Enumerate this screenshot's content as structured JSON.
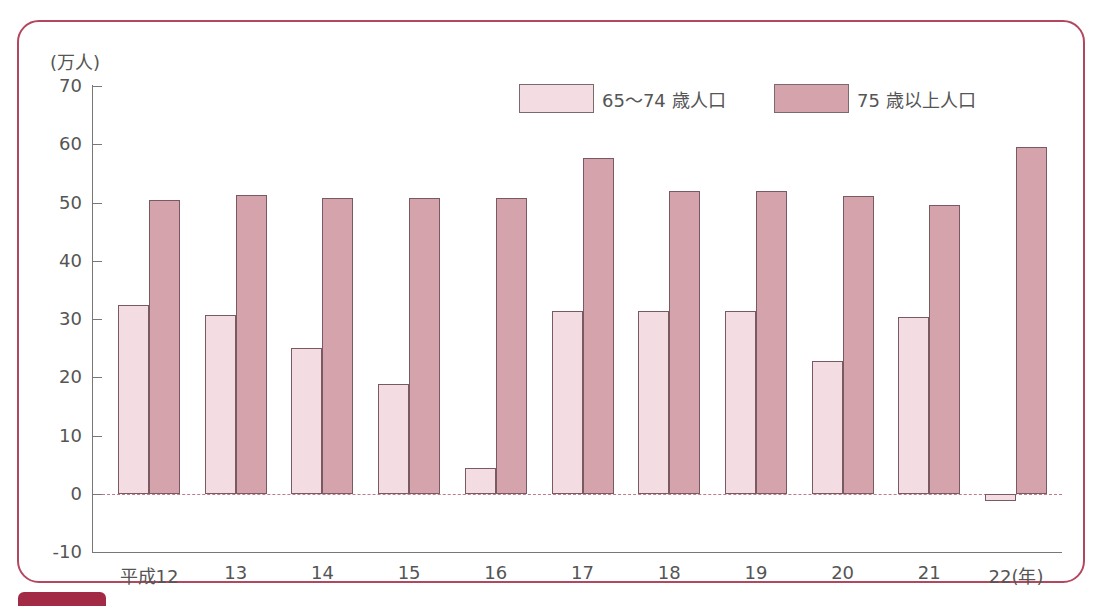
{
  "chart_data": {
    "type": "bar",
    "title": "",
    "ylabel": "(万人)",
    "xlabel": "(年)",
    "ylim": [
      -10,
      70
    ],
    "yticks": [
      70,
      60,
      50,
      40,
      30,
      20,
      10,
      0,
      -10
    ],
    "grid": false,
    "legend_position": "top-right",
    "categories": [
      "平成12",
      "13",
      "14",
      "15",
      "16",
      "17",
      "18",
      "19",
      "20",
      "21",
      "22(年)"
    ],
    "series": [
      {
        "name": "65〜74 歳人口",
        "color": "#f4dde2",
        "values": [
          32.5,
          30.7,
          25.1,
          18.9,
          4.5,
          31.4,
          31.4,
          31.4,
          22.8,
          30.3,
          -1.2
        ]
      },
      {
        "name": "75 歳以上人口",
        "color": "#d4a3ac",
        "values": [
          50.5,
          51.3,
          50.7,
          50.7,
          50.7,
          57.6,
          51.9,
          51.9,
          51.1,
          49.6,
          59.6
        ]
      }
    ]
  },
  "labels": {
    "unit": "(万人)",
    "legend": [
      "65〜74 歳人口",
      "75 歳以上人口"
    ]
  },
  "colors": {
    "frame": "#b2475e",
    "series_young": "#f4dde2",
    "series_old": "#d4a3ac"
  }
}
